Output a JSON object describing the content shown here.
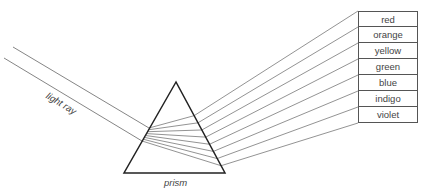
{
  "labels": {
    "light_ray": "light ray",
    "prism": "prism"
  },
  "spectrum": [
    {
      "color": "red"
    },
    {
      "color": "orange"
    },
    {
      "color": "yellow"
    },
    {
      "color": "green"
    },
    {
      "color": "blue"
    },
    {
      "color": "indigo"
    },
    {
      "color": "violet"
    }
  ],
  "geometry": {
    "prism": {
      "apex": [
        176,
        82
      ],
      "base_left": [
        124,
        173
      ],
      "base_right": [
        225,
        173
      ]
    },
    "incoming_ray": {
      "top": [
        [
          13,
          47
        ],
        [
          149,
          128
        ]
      ],
      "bottom": [
        [
          4,
          58
        ],
        [
          142,
          141
        ]
      ]
    },
    "box_left_x": 358,
    "box_row_edges_y": [
      11,
      27,
      43,
      59,
      75,
      91,
      107,
      123
    ]
  },
  "colors": {
    "line": "#555555",
    "prism_outline": "#222222",
    "text": "#444444"
  }
}
